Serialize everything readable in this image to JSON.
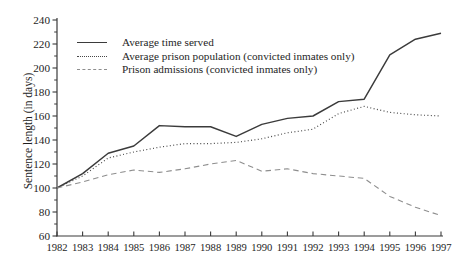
{
  "figure": {
    "background_color": "#ffffff",
    "axis_color": "#3a3a3a",
    "text_color": "#1e1e1e"
  },
  "chart_data": {
    "type": "line",
    "title": "",
    "xlabel": "",
    "ylabel": "Sentence length (in days)",
    "x": [
      1982,
      1983,
      1984,
      1985,
      1986,
      1987,
      1988,
      1989,
      1990,
      1991,
      1992,
      1993,
      1994,
      1995,
      1996,
      1997
    ],
    "ylim": [
      60,
      240
    ],
    "yticks": [
      60,
      80,
      100,
      120,
      140,
      160,
      180,
      200,
      220,
      240
    ],
    "ytick_minor_interval": 10,
    "grid": false,
    "legend_position": "top-left-inside",
    "series": [
      {
        "name": "Average time served",
        "style": "solid",
        "color": "#3b3b3b",
        "values": [
          100,
          112,
          129,
          135,
          152,
          151,
          151,
          143,
          153,
          158,
          160,
          172,
          174,
          211,
          224,
          229
        ]
      },
      {
        "name": "Average prison population (convicted inmates only)",
        "style": "dotted",
        "color": "#474747",
        "values": [
          100,
          110,
          125,
          130,
          134,
          137,
          137,
          138,
          141,
          146,
          149,
          162,
          168,
          163,
          161,
          160
        ]
      },
      {
        "name": "Prison admissions (convicted inmates only)",
        "style": "dashed",
        "color": "#8e8e8e",
        "values": [
          100,
          105,
          111,
          115,
          113,
          116,
          120,
          123,
          114,
          116,
          112,
          110,
          108,
          93,
          84,
          77
        ]
      }
    ]
  }
}
